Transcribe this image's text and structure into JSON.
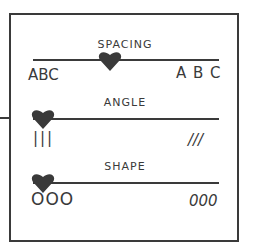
{
  "sliders": [
    {
      "label": "SPACING",
      "min_label": "ABC",
      "max_label": "A B C",
      "value_pct": 42
    },
    {
      "label": "ANGLE",
      "min_label": "|||",
      "max_label": "///",
      "value_pct": 0
    },
    {
      "label": "SHAPE",
      "min_label": "OOO",
      "max_label": "000",
      "value_pct": 0
    }
  ],
  "colors": {
    "ink": "#3a3a3a"
  }
}
